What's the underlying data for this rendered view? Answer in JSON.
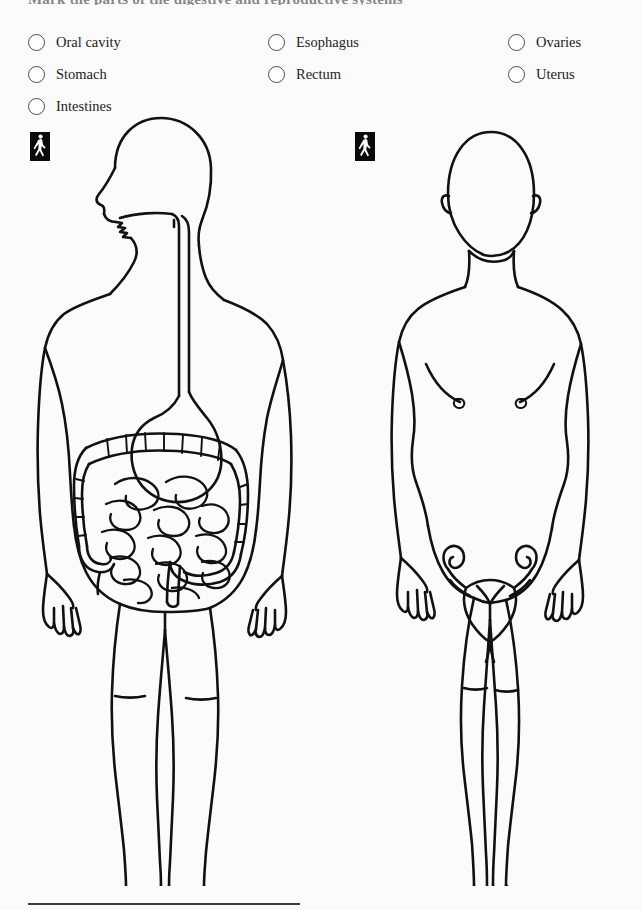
{
  "page": {
    "title_sliver": "Mark the parts of the digestive and reproductive systems",
    "background_color": "#fbfbfb",
    "ink_color": "#111111"
  },
  "legend": {
    "columns": [
      {
        "name": "digestive-upper",
        "options": [
          {
            "label": "Oral cavity",
            "checked": false
          },
          {
            "label": "Stomach",
            "checked": false
          },
          {
            "label": "Intestines",
            "checked": false
          }
        ]
      },
      {
        "name": "digestive-lower",
        "options": [
          {
            "label": "Esophagus",
            "checked": false
          },
          {
            "label": "Rectum",
            "checked": false
          }
        ]
      },
      {
        "name": "reproductive",
        "options": [
          {
            "label": "Ovaries",
            "checked": false
          },
          {
            "label": "Uterus",
            "checked": false
          }
        ]
      }
    ]
  },
  "badges": [
    {
      "name": "walking-person-badge-male",
      "icon": "walking-person-icon",
      "background": "#0a0a0a",
      "glyph_color": "#ffffff"
    },
    {
      "name": "walking-person-badge-female",
      "icon": "walking-person-icon",
      "background": "#0a0a0a",
      "glyph_color": "#ffffff"
    }
  ],
  "figures": [
    {
      "name": "male-body-diagram",
      "sex": "male",
      "view": "anterior, head in left profile",
      "organs_shown": [
        "oral cavity",
        "esophagus",
        "stomach",
        "small intestine",
        "large intestine",
        "rectum"
      ]
    },
    {
      "name": "female-body-diagram",
      "sex": "female",
      "view": "anterior",
      "organs_shown": [
        "uterus",
        "fallopian tubes",
        "ovaries"
      ]
    }
  ],
  "footer": {
    "divider": true,
    "divider_color": "#3c3c3c"
  }
}
